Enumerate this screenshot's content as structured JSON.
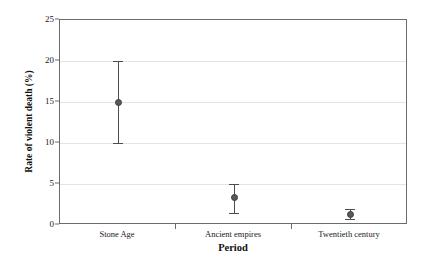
{
  "chart_data": {
    "type": "scatter",
    "title": "",
    "xlabel": "Period",
    "ylabel": "Rate of violent death (%)",
    "categories": [
      "Stone Age",
      "Ancient empires",
      "Twentieth century"
    ],
    "values": [
      15.0,
      3.3,
      1.3
    ],
    "error_low": [
      10.0,
      1.5,
      0.7
    ],
    "error_high": [
      20.0,
      5.0,
      1.9
    ],
    "ylim": [
      0,
      25
    ],
    "yticks": [
      0,
      5,
      10,
      15,
      20,
      25
    ],
    "ytick_labels": [
      "0",
      "5",
      "10",
      "15",
      "20",
      "25"
    ],
    "grid": "horizontal",
    "legend": "none",
    "series": [
      {
        "name": "Rate of violent death",
        "values": [
          15.0,
          3.3,
          1.3
        ],
        "error_low": [
          10.0,
          1.5,
          0.7
        ],
        "error_high": [
          20.0,
          5.0,
          1.9
        ]
      }
    ],
    "marker_color": "#595959",
    "errorbar_color": "#4d4d4d",
    "gridline_color": "#e3e3e3",
    "frame_color": "#6b6b6b",
    "background_color": "#ffffff"
  }
}
